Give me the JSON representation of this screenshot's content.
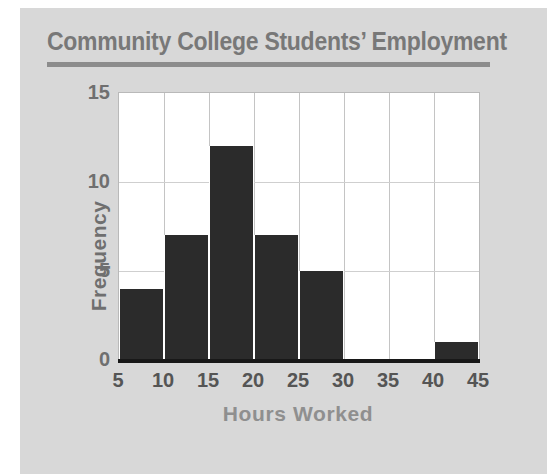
{
  "chart_data": {
    "type": "bar",
    "title": "Community College Students’ Employment",
    "xlabel": "Hours Worked",
    "ylabel": "Frequency",
    "bin_width": 5,
    "bin_edges": [
      5,
      10,
      15,
      20,
      25,
      30,
      35,
      40,
      45
    ],
    "categories": [
      "5-10",
      "10-15",
      "15-20",
      "20-25",
      "25-30",
      "30-35",
      "35-40",
      "40-45"
    ],
    "values": [
      4,
      7,
      12,
      7,
      5,
      0,
      0,
      1
    ],
    "xlim": [
      5,
      45
    ],
    "ylim": [
      0,
      15
    ],
    "xticks": [
      "5",
      "10",
      "15",
      "20",
      "25",
      "30",
      "35",
      "40",
      "45"
    ],
    "yticks": [
      "0",
      "5",
      "10",
      "15"
    ],
    "grid": true,
    "legend": "none",
    "colors": {
      "bar": "#2b2b2b",
      "panel": "#d8d8d8",
      "plot_background": "#ffffff",
      "title": "#787878",
      "tick_label": "#6f6f6f",
      "axis_line": "#181818",
      "grid_line": "#c4c4c4",
      "title_rule": "#8c8c8c"
    }
  }
}
